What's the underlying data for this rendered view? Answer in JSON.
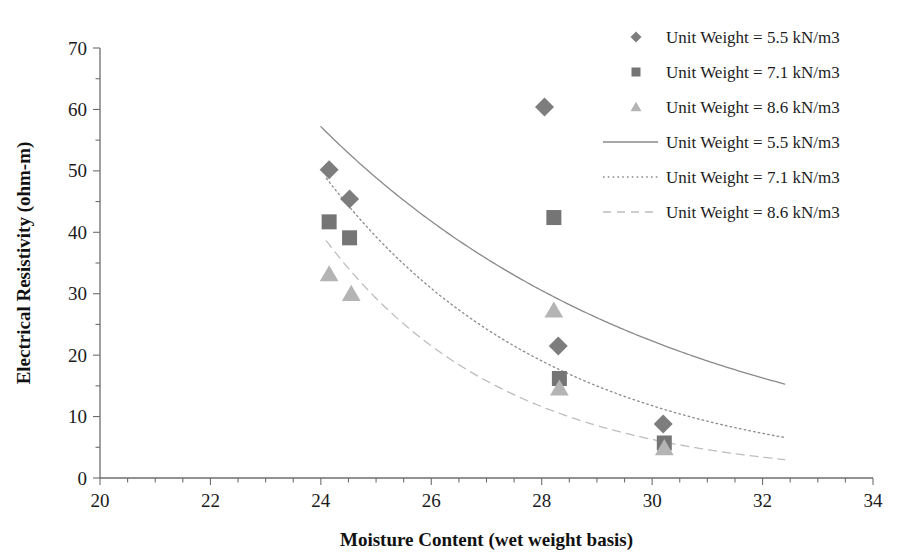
{
  "chart_data": {
    "type": "scatter",
    "title": "",
    "xlabel": "Moisture Content (wet weight basis)",
    "ylabel": "Electrical Resistivity (ohm-m)",
    "xlim": [
      20,
      34
    ],
    "ylim": [
      0,
      70
    ],
    "xticks": [
      20,
      22,
      24,
      26,
      28,
      30,
      32,
      34
    ],
    "yticks": [
      0,
      10,
      20,
      30,
      40,
      50,
      60,
      70
    ],
    "xtick_labels": [
      "20",
      "22",
      "24",
      "26",
      "28",
      "30",
      "32",
      "34"
    ],
    "ytick_labels": [
      "0",
      "10",
      "20",
      "30",
      "40",
      "50",
      "60",
      "70"
    ],
    "x_minor_step": 0.5,
    "y_minor_step": 5,
    "grid": false,
    "legend_position": "top-right",
    "series": [
      {
        "name": "Unit Weight = 5.5 kN/m3",
        "marker": "diamond",
        "color": "#7d7d7d",
        "points": [
          {
            "x": 24.15,
            "y": 50.2
          },
          {
            "x": 24.52,
            "y": 45.4
          },
          {
            "x": 28.05,
            "y": 60.4
          },
          {
            "x": 28.3,
            "y": 21.5
          },
          {
            "x": 30.2,
            "y": 8.8
          }
        ]
      },
      {
        "name": "Unit Weight = 7.1 kN/m3",
        "marker": "square",
        "color": "#757575",
        "points": [
          {
            "x": 24.15,
            "y": 41.7
          },
          {
            "x": 24.52,
            "y": 39.1
          },
          {
            "x": 28.22,
            "y": 42.4
          },
          {
            "x": 28.32,
            "y": 16.2
          },
          {
            "x": 30.22,
            "y": 5.7
          }
        ]
      },
      {
        "name": "Unit Weight = 8.6 kN/m3",
        "marker": "triangle",
        "color": "#b4b4b4",
        "points": [
          {
            "x": 24.15,
            "y": 33.2
          },
          {
            "x": 24.55,
            "y": 30.0
          },
          {
            "x": 28.22,
            "y": 27.3
          },
          {
            "x": 28.32,
            "y": 14.6
          },
          {
            "x": 30.22,
            "y": 4.9
          }
        ]
      }
    ],
    "fits": [
      {
        "name": "Unit Weight = 5.5 kN/m3",
        "style": "solid",
        "color": "#8a8a8a",
        "x_start": 24.0,
        "x_end": 32.4,
        "y_start": 57.2,
        "y_end": 15.3
      },
      {
        "name": "Unit Weight = 7.1 kN/m3",
        "style": "dotted",
        "color": "#8a8a8a",
        "x_start": 24.1,
        "x_end": 32.4,
        "y_start": 48.8,
        "y_end": 6.6
      },
      {
        "name": "Unit Weight = 8.6 kN/m3",
        "style": "dashed",
        "color": "#bdbdbd",
        "x_start": 24.1,
        "x_end": 32.4,
        "y_start": 38.6,
        "y_end": 3.0
      }
    ],
    "legend": [
      {
        "label": "Unit Weight = 5.5 kN/m3",
        "kind": "marker",
        "marker": "diamond",
        "color": "#7d7d7d"
      },
      {
        "label": "Unit Weight = 7.1 kN/m3",
        "kind": "marker",
        "marker": "square",
        "color": "#757575"
      },
      {
        "label": "Unit Weight = 8.6 kN/m3",
        "kind": "marker",
        "marker": "triangle",
        "color": "#b4b4b4"
      },
      {
        "label": "Unit Weight = 5.5 kN/m3",
        "kind": "line",
        "style": "solid",
        "color": "#8a8a8a"
      },
      {
        "label": "Unit Weight = 7.1 kN/m3",
        "kind": "line",
        "style": "dotted",
        "color": "#8a8a8a"
      },
      {
        "label": "Unit Weight = 8.6 kN/m3",
        "kind": "line",
        "style": "dashed",
        "color": "#bdbdbd"
      }
    ]
  },
  "colors": {
    "axis": "#6e6e6e",
    "text": "#1a1a1a",
    "background": "#ffffff"
  }
}
